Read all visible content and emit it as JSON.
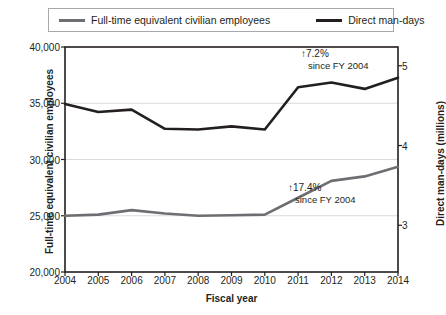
{
  "legend": {
    "entries": [
      {
        "label": "Full-time equivalent civilian employees",
        "color": "#6d6e71",
        "icon": "line-swatch-icon"
      },
      {
        "label": "Direct man-days",
        "color": "#231f20",
        "icon": "line-swatch-icon"
      }
    ]
  },
  "annotations": [
    {
      "id": "upper",
      "line1": "↑7.2%",
      "line2": "since FY 2004"
    },
    {
      "id": "lower",
      "line1": "↑17.4%",
      "line2": "since FY 2004"
    }
  ],
  "chart_data": {
    "type": "line",
    "title": "",
    "xlabel": "Fiscal year",
    "ylabel": "Full-time equivalent civilian employees",
    "y2label": "Direct man-days (millions)",
    "grid": true,
    "legend_position": "top",
    "x": [
      2004,
      2005,
      2006,
      2007,
      2008,
      2009,
      2010,
      2011,
      2012,
      2013,
      2014
    ],
    "categories": [
      "2004",
      "2005",
      "2006",
      "2007",
      "2008",
      "2009",
      "2010",
      "2011",
      "2012",
      "2013",
      "2014"
    ],
    "xlim": [
      2004,
      2014
    ],
    "ylim": [
      20000,
      40000
    ],
    "yticks": [
      20000,
      25000,
      30000,
      35000,
      40000
    ],
    "ytick_labels": [
      "20,000",
      "25,000",
      "30,000",
      "35,000",
      "40,000"
    ],
    "y2lim": [
      2.4142,
      5.2353
    ],
    "y2ticks": [
      3,
      4,
      5
    ],
    "y2tick_labels": [
      "3",
      "4",
      "5"
    ],
    "series": [
      {
        "name": "Full-time equivalent civilian employees",
        "axis": "left",
        "color": "#6d6e71",
        "values": [
          25000,
          25100,
          25500,
          25200,
          25000,
          25050,
          25100,
          26600,
          28100,
          28500,
          29350
        ]
      },
      {
        "name": "Direct man-days",
        "axis": "right",
        "color": "#231f20",
        "units": "millions",
        "values": [
          4.52,
          4.42,
          4.45,
          4.21,
          4.2,
          4.24,
          4.2,
          4.73,
          4.79,
          4.71,
          4.85
        ]
      }
    ]
  }
}
